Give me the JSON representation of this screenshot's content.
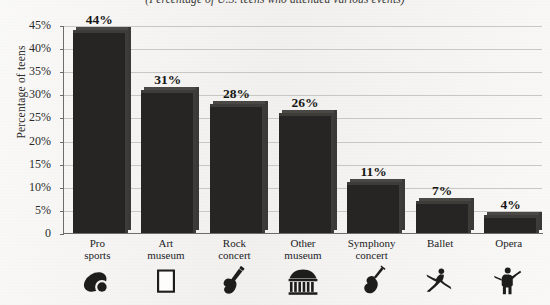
{
  "subtitle": "(Percentage of U.S. teens who attended various events)",
  "axis": {
    "y_title": "Percentage of teens",
    "y_ticks": [
      "0",
      "5%",
      "10%",
      "15%",
      "20%",
      "25%",
      "30%",
      "35%",
      "40%",
      "45%"
    ]
  },
  "colors": {
    "bar": "#262523",
    "bar_highlight": "#4a4845",
    "gridline": "#c9c7c3",
    "axis": "#6e6c68",
    "paper": "#f3f2f0",
    "text": "#22221f"
  },
  "chart_data": {
    "type": "bar",
    "title": "",
    "subtitle": "(Percentage of U.S. teens who attended various events)",
    "categories": [
      "Pro sports",
      "Art museum",
      "Rock concert",
      "Other museum",
      "Symphony concert",
      "Ballet",
      "Opera"
    ],
    "category_lines": [
      [
        "Pro",
        "sports"
      ],
      [
        "Art",
        "museum"
      ],
      [
        "Rock",
        "concert"
      ],
      [
        "Other",
        "museum"
      ],
      [
        "Symphony",
        "concert"
      ],
      [
        "Ballet"
      ],
      [
        "Opera"
      ]
    ],
    "values": [
      44,
      31,
      28,
      26,
      11,
      7,
      4
    ],
    "value_labels": [
      "44%",
      "31%",
      "28%",
      "26%",
      "11%",
      "7%",
      "4%"
    ],
    "icons": [
      "football-icon",
      "picture-frame-icon",
      "electric-guitar-icon",
      "museum-building-icon",
      "violin-icon",
      "ballet-dancer-icon",
      "opera-singer-icon"
    ],
    "xlabel": "",
    "ylabel": "Percentage of teens",
    "ylim": [
      0,
      45
    ],
    "ytick_step": 5,
    "grid": true,
    "legend": "none"
  }
}
